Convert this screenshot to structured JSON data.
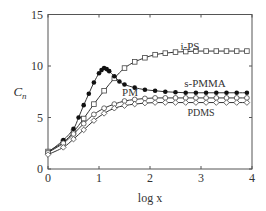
{
  "chart_data": {
    "type": "line",
    "title": "",
    "xlabel": "log x",
    "ylabel": "C_n",
    "xlim": [
      0,
      4
    ],
    "ylim": [
      0,
      15
    ],
    "xticks": [
      0,
      1,
      2,
      3,
      4
    ],
    "yticks": [
      0,
      5,
      10,
      15
    ],
    "grid": false,
    "legend_position": "inline labels",
    "series": [
      {
        "name": "i-PS",
        "marker": "open-square",
        "x": [
          0,
          0.3,
          0.5,
          0.7,
          0.9,
          1.1,
          1.3,
          1.5,
          1.7,
          1.9,
          2.1,
          2.3,
          2.5,
          2.7,
          2.9,
          3.1,
          3.3,
          3.5,
          3.7,
          3.9
        ],
        "values": [
          1.7,
          2.6,
          3.6,
          4.9,
          6.3,
          7.6,
          8.8,
          9.8,
          10.4,
          10.8,
          11.1,
          11.25,
          11.35,
          11.4,
          11.45,
          11.45,
          11.45,
          11.45,
          11.45,
          11.45
        ]
      },
      {
        "name": "s-PMMA",
        "marker": "filled-circle",
        "x": [
          0,
          0.3,
          0.5,
          0.6,
          0.7,
          0.8,
          0.9,
          1.0,
          1.05,
          1.1,
          1.15,
          1.2,
          1.3,
          1.4,
          1.5,
          1.7,
          1.9,
          2.1,
          2.3,
          2.5,
          2.7,
          2.9,
          3.1,
          3.3,
          3.5,
          3.7,
          3.9
        ],
        "values": [
          1.6,
          2.8,
          3.9,
          5.0,
          6.2,
          7.3,
          8.4,
          9.3,
          9.6,
          9.8,
          9.7,
          9.5,
          9.0,
          8.5,
          8.2,
          7.9,
          7.7,
          7.6,
          7.5,
          7.45,
          7.4,
          7.4,
          7.4,
          7.4,
          7.4,
          7.4,
          7.4
        ]
      },
      {
        "name": "PM",
        "marker": "open-circle",
        "x": [
          0,
          0.3,
          0.5,
          0.7,
          0.9,
          1.1,
          1.3,
          1.5,
          1.7,
          1.9,
          2.1,
          2.3,
          2.5,
          2.7,
          2.9,
          3.1,
          3.3,
          3.5,
          3.7,
          3.9
        ],
        "values": [
          1.6,
          2.5,
          3.4,
          4.4,
          5.3,
          5.9,
          6.3,
          6.6,
          6.75,
          6.85,
          6.9,
          6.9,
          6.9,
          6.9,
          6.9,
          6.9,
          6.9,
          6.9,
          6.9,
          6.9
        ]
      },
      {
        "name": "PDMS",
        "marker": "open-diamond",
        "x": [
          0,
          0.3,
          0.5,
          0.7,
          0.9,
          1.1,
          1.3,
          1.5,
          1.7,
          1.9,
          2.1,
          2.3,
          2.5,
          2.7,
          2.9,
          3.1,
          3.3,
          3.5,
          3.7,
          3.9
        ],
        "values": [
          1.4,
          2.1,
          2.9,
          3.8,
          4.7,
          5.4,
          5.9,
          6.15,
          6.3,
          6.4,
          6.45,
          6.45,
          6.45,
          6.45,
          6.45,
          6.45,
          6.45,
          6.45,
          6.45,
          6.45
        ]
      }
    ],
    "annotations": [
      {
        "text": "i-PS",
        "x": 2.95,
        "y": 12.3
      },
      {
        "text": "s-PMMA",
        "x": 3.1,
        "y": 8.0
      },
      {
        "text": "PM",
        "x": 1.42,
        "y": 7.4
      },
      {
        "text": "PDMS",
        "x": 3.05,
        "y": 5.4
      }
    ]
  },
  "labels": {
    "ylabel_main": "C",
    "ylabel_sub": "n",
    "xlabel": "log x",
    "xtick_labels": [
      "0",
      "1",
      "2",
      "3",
      "4"
    ],
    "ytick_labels": [
      "0",
      "5",
      "10",
      "15"
    ],
    "series_labels": {
      "ips": "i-PS",
      "spmma": "s-PMMA",
      "pm": "PM",
      "pdms": "PDMS"
    }
  }
}
